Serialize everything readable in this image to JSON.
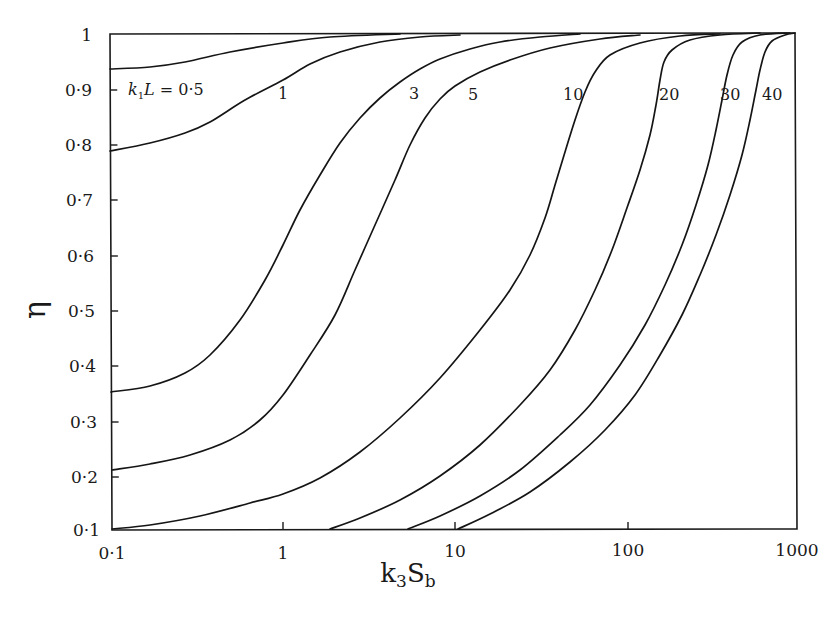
{
  "chart_data": {
    "type": "line",
    "title": "",
    "xlabel": "k3Sb",
    "xlabel_parts": {
      "base": "k",
      "sub1": "3",
      "mid": "S",
      "sub2": "b"
    },
    "ylabel": "η",
    "xscale": "log",
    "xlim": [
      0.1,
      1000
    ],
    "ylim": [
      0.1,
      1.0
    ],
    "grid": false,
    "legend": "inline curve labels",
    "x_ticks": [
      "0·1",
      "1",
      "10",
      "100",
      "1000"
    ],
    "y_ticks": [
      "0·1",
      "0·2",
      "0·3",
      "0·4",
      "0·5",
      "0·6",
      "0·7",
      "0·8",
      "0·9",
      "1"
    ],
    "parameter": "k2L",
    "series": [
      {
        "name": "k2L = 0·5",
        "label": "k₂L = 0·5",
        "x": [
          0.1,
          0.3,
          1,
          3,
          10,
          30
        ],
        "y": [
          0.935,
          0.945,
          0.975,
          0.995,
          1.0,
          1.0
        ]
      },
      {
        "name": "k2L = 1",
        "label": "1",
        "x": [
          0.1,
          0.3,
          1,
          2,
          5,
          10,
          30
        ],
        "y": [
          0.79,
          0.83,
          0.91,
          0.96,
          0.99,
          1.0,
          1.0
        ]
      },
      {
        "name": "k2L = 3",
        "label": "3",
        "x": [
          0.1,
          0.3,
          1,
          2,
          5,
          10,
          30
        ],
        "y": [
          0.355,
          0.4,
          0.58,
          0.77,
          0.94,
          0.98,
          1.0
        ]
      },
      {
        "name": "k2L = 5",
        "label": "5",
        "x": [
          0.1,
          0.3,
          1,
          3,
          6,
          10,
          30,
          100
        ],
        "y": [
          0.21,
          0.24,
          0.3,
          0.52,
          0.78,
          0.93,
          0.99,
          1.0
        ]
      },
      {
        "name": "k2L = 10",
        "label": "10",
        "x": [
          0.1,
          0.3,
          1,
          3,
          10,
          30,
          50,
          100
        ],
        "y": [
          0.1,
          0.11,
          0.15,
          0.27,
          0.55,
          0.88,
          0.96,
          1.0
        ]
      },
      {
        "name": "k2L = 20",
        "label": "20",
        "x": [
          2,
          5,
          10,
          30,
          100,
          150,
          200
        ],
        "y": [
          0.1,
          0.17,
          0.25,
          0.45,
          0.78,
          0.93,
          1.0
        ]
      },
      {
        "name": "k2L = 30",
        "label": "30",
        "x": [
          5.5,
          10,
          30,
          100,
          300,
          400
        ],
        "y": [
          0.1,
          0.15,
          0.3,
          0.58,
          0.93,
          1.0
        ]
      },
      {
        "name": "k2L = 40",
        "label": "40",
        "x": [
          10.5,
          30,
          100,
          300,
          600,
          800
        ],
        "y": [
          0.1,
          0.2,
          0.42,
          0.75,
          0.96,
          1.0
        ]
      }
    ]
  },
  "render": {
    "frame": {
      "left_top": [
        110,
        34
      ],
      "left_bottom": [
        112,
        530
      ],
      "right_top": [
        795,
        33
      ],
      "right_bottom": [
        797,
        529
      ]
    },
    "x_ticks_px": [
      {
        "label": "0·1",
        "x": 112,
        "ly": 559
      },
      {
        "label": "1",
        "x": 283,
        "ly": 559
      },
      {
        "label": "10",
        "x": 455,
        "ly": 557
      },
      {
        "label": "100",
        "x": 628,
        "ly": 556
      },
      {
        "label": "1000",
        "x": 797,
        "ly": 556
      }
    ],
    "y_ticks_px": [
      {
        "label": "1",
        "y": 35,
        "lx": 92
      },
      {
        "label": "0·9",
        "y": 90,
        "lx": 92
      },
      {
        "label": "0·8",
        "y": 145,
        "lx": 92
      },
      {
        "label": "0·7",
        "y": 200,
        "lx": 93
      },
      {
        "label": "0·6",
        "y": 256,
        "lx": 94
      },
      {
        "label": "0·5",
        "y": 311,
        "lx": 95
      },
      {
        "label": "0·4",
        "y": 366,
        "lx": 96
      },
      {
        "label": "0·3",
        "y": 422,
        "lx": 97
      },
      {
        "label": "0·2",
        "y": 477,
        "lx": 98
      },
      {
        "label": "0·1",
        "y": 530,
        "lx": 100
      }
    ],
    "curves_px": [
      {
        "id": "k2L-0-5",
        "pts": [
          [
            110,
            69
          ],
          [
            150,
            67
          ],
          [
            185,
            62
          ],
          [
            230,
            52
          ],
          [
            283,
            43
          ],
          [
            330,
            37
          ],
          [
            400,
            34
          ]
        ]
      },
      {
        "id": "k2L-1",
        "pts": [
          [
            110,
            151
          ],
          [
            150,
            143
          ],
          [
            185,
            133
          ],
          [
            210,
            122
          ],
          [
            245,
            100
          ],
          [
            283,
            80
          ],
          [
            310,
            64
          ],
          [
            340,
            52
          ],
          [
            380,
            42
          ],
          [
            420,
            37
          ],
          [
            460,
            35
          ]
        ]
      },
      {
        "id": "k2L-3",
        "pts": [
          [
            111,
            392
          ],
          [
            150,
            386
          ],
          [
            185,
            373
          ],
          [
            210,
            355
          ],
          [
            240,
            320
          ],
          [
            265,
            280
          ],
          [
            283,
            245
          ],
          [
            300,
            210
          ],
          [
            320,
            175
          ],
          [
            340,
            143
          ],
          [
            360,
            118
          ],
          [
            380,
            98
          ],
          [
            400,
            82
          ],
          [
            420,
            69
          ],
          [
            440,
            59
          ],
          [
            470,
            49
          ],
          [
            500,
            42
          ],
          [
            540,
            37
          ],
          [
            580,
            34
          ]
        ]
      },
      {
        "id": "k2L-5",
        "pts": [
          [
            112,
            470
          ],
          [
            150,
            464
          ],
          [
            190,
            455
          ],
          [
            230,
            440
          ],
          [
            260,
            420
          ],
          [
            283,
            395
          ],
          [
            310,
            355
          ],
          [
            335,
            315
          ],
          [
            355,
            270
          ],
          [
            375,
            225
          ],
          [
            395,
            180
          ],
          [
            410,
            145
          ],
          [
            425,
            118
          ],
          [
            440,
            99
          ],
          [
            455,
            86
          ],
          [
            480,
            72
          ],
          [
            510,
            60
          ],
          [
            550,
            48
          ],
          [
            600,
            39
          ],
          [
            640,
            35
          ]
        ]
      },
      {
        "id": "k2L-10",
        "pts": [
          [
            112,
            529
          ],
          [
            150,
            525
          ],
          [
            200,
            516
          ],
          [
            250,
            503
          ],
          [
            283,
            494
          ],
          [
            320,
            478
          ],
          [
            360,
            452
          ],
          [
            400,
            418
          ],
          [
            440,
            378
          ],
          [
            480,
            330
          ],
          [
            510,
            290
          ],
          [
            530,
            255
          ],
          [
            545,
            218
          ],
          [
            555,
            185
          ],
          [
            565,
            152
          ],
          [
            575,
            120
          ],
          [
            585,
            92
          ],
          [
            595,
            72
          ],
          [
            610,
            55
          ],
          [
            640,
            43
          ],
          [
            680,
            36
          ],
          [
            720,
            34
          ]
        ]
      },
      {
        "id": "k2L-20",
        "pts": [
          [
            330,
            529
          ],
          [
            360,
            518
          ],
          [
            400,
            500
          ],
          [
            440,
            476
          ],
          [
            480,
            445
          ],
          [
            520,
            405
          ],
          [
            550,
            370
          ],
          [
            575,
            330
          ],
          [
            595,
            290
          ],
          [
            612,
            250
          ],
          [
            628,
            205
          ],
          [
            640,
            170
          ],
          [
            650,
            135
          ],
          [
            656,
            105
          ],
          [
            660,
            80
          ],
          [
            664,
            62
          ],
          [
            672,
            50
          ],
          [
            690,
            40
          ],
          [
            720,
            35
          ],
          [
            760,
            33
          ]
        ]
      },
      {
        "id": "k2L-30",
        "pts": [
          [
            408,
            529
          ],
          [
            440,
            516
          ],
          [
            480,
            496
          ],
          [
            520,
            470
          ],
          [
            560,
            435
          ],
          [
            590,
            405
          ],
          [
            620,
            365
          ],
          [
            645,
            325
          ],
          [
            665,
            285
          ],
          [
            682,
            245
          ],
          [
            696,
            205
          ],
          [
            708,
            165
          ],
          [
            716,
            130
          ],
          [
            722,
            100
          ],
          [
            727,
            75
          ],
          [
            733,
            55
          ],
          [
            742,
            42
          ],
          [
            760,
            35
          ],
          [
            790,
            33
          ]
        ]
      },
      {
        "id": "k2L-40",
        "pts": [
          [
            458,
            529
          ],
          [
            490,
            514
          ],
          [
            530,
            492
          ],
          [
            570,
            462
          ],
          [
            605,
            430
          ],
          [
            635,
            395
          ],
          [
            660,
            355
          ],
          [
            682,
            315
          ],
          [
            700,
            275
          ],
          [
            716,
            235
          ],
          [
            730,
            195
          ],
          [
            742,
            155
          ],
          [
            750,
            120
          ],
          [
            756,
            90
          ],
          [
            760,
            70
          ],
          [
            765,
            52
          ],
          [
            772,
            41
          ],
          [
            785,
            35
          ],
          [
            795,
            33
          ]
        ]
      }
    ],
    "labels_px": [
      {
        "id": "label-0-5",
        "text_parts": {
          "k": "k",
          "sub": "1",
          "L": "L",
          "rest": " = 0·5"
        },
        "x": 128,
        "y": 95
      },
      {
        "id": "label-1",
        "text": "1",
        "x": 278,
        "y": 99
      },
      {
        "id": "label-3",
        "text": "3",
        "x": 409,
        "y": 99
      },
      {
        "id": "label-5",
        "text": "5",
        "x": 468,
        "y": 100
      },
      {
        "id": "label-10",
        "text": "10",
        "x": 563,
        "y": 100
      },
      {
        "id": "label-20",
        "text": "20",
        "x": 659,
        "y": 100
      },
      {
        "id": "label-30",
        "text": "30",
        "x": 720,
        "y": 100
      },
      {
        "id": "label-40",
        "text": "40",
        "x": 762,
        "y": 100
      }
    ],
    "xlabel_pos": {
      "x": 408,
      "y": 582
    },
    "ylabel_pos": {
      "x": 45,
      "y": 310
    }
  }
}
